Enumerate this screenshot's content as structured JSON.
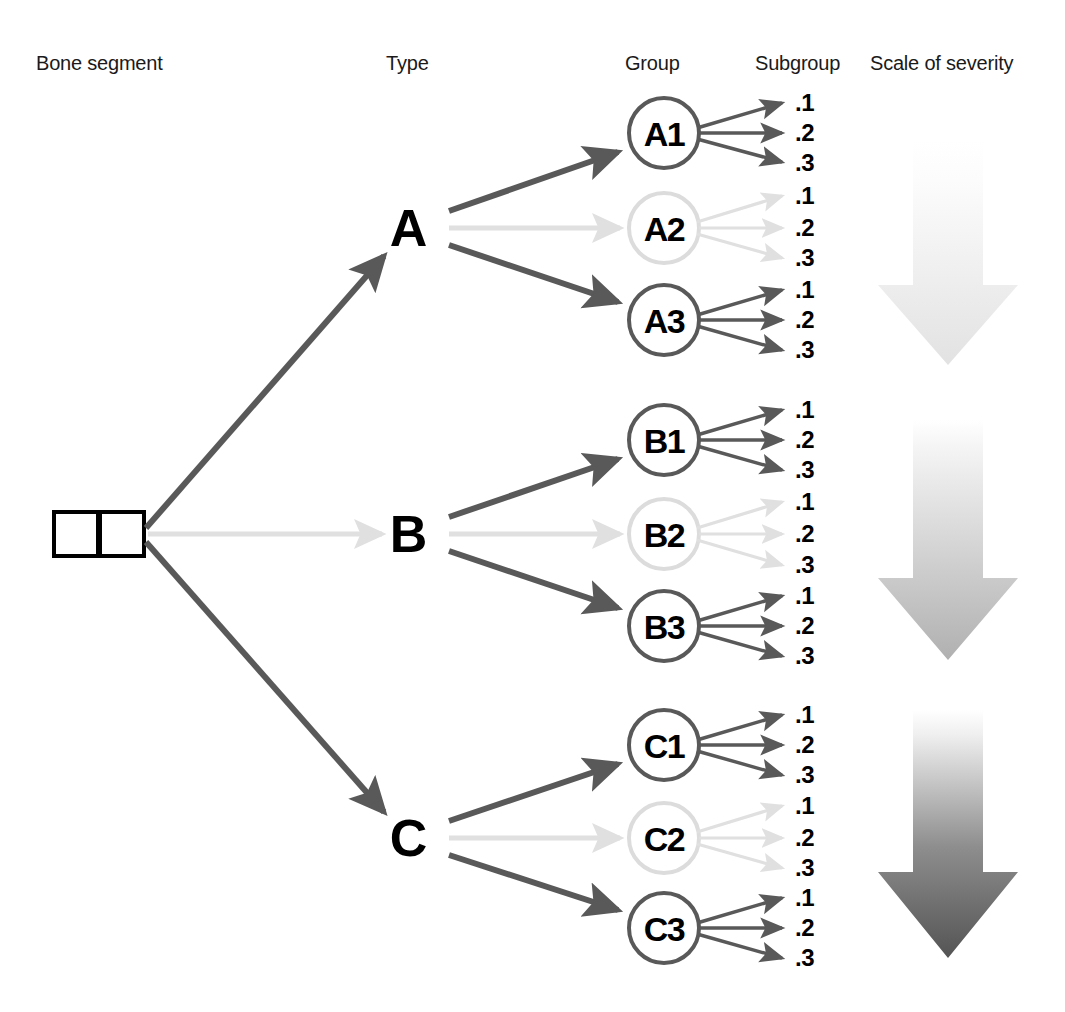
{
  "headers": [
    {
      "label": "Bone segment",
      "x": 36,
      "y": 52
    },
    {
      "label": "Type",
      "x": 386,
      "y": 52
    },
    {
      "label": "Group",
      "x": 625,
      "y": 52
    },
    {
      "label": "Subgroup",
      "x": 755,
      "y": 52
    },
    {
      "label": "Scale of severity",
      "x": 870,
      "y": 52
    }
  ],
  "bone_segment": {
    "name": "bone-segment-squares",
    "squares": [
      {
        "x": 54,
        "y": 512,
        "size": 44
      },
      {
        "x": 98,
        "y": 512,
        "size": 44
      }
    ],
    "border_color": "#000000"
  },
  "types": [
    {
      "id": "A",
      "label": "A",
      "x": 408,
      "y": 228
    },
    {
      "id": "B",
      "label": "B",
      "x": 408,
      "y": 534
    },
    {
      "id": "C",
      "label": "C",
      "x": 408,
      "y": 838
    }
  ],
  "groups": [
    {
      "id": "A1",
      "label": "A1",
      "cx": 664,
      "cy": 133,
      "r": 36,
      "tone": "dark"
    },
    {
      "id": "A2",
      "label": "A2",
      "cx": 664,
      "cy": 228,
      "r": 36,
      "tone": "light"
    },
    {
      "id": "A3",
      "label": "A3",
      "cx": 664,
      "cy": 320,
      "r": 36,
      "tone": "dark"
    },
    {
      "id": "B1",
      "label": "B1",
      "cx": 664,
      "cy": 440,
      "r": 36,
      "tone": "dark"
    },
    {
      "id": "B2",
      "label": "B2",
      "cx": 664,
      "cy": 534,
      "r": 36,
      "tone": "light"
    },
    {
      "id": "B3",
      "label": "B3",
      "cx": 664,
      "cy": 626,
      "r": 36,
      "tone": "dark"
    },
    {
      "id": "C1",
      "label": "C1",
      "cx": 664,
      "cy": 745,
      "r": 36,
      "tone": "dark"
    },
    {
      "id": "C2",
      "label": "C2",
      "cx": 664,
      "cy": 838,
      "r": 36,
      "tone": "light"
    },
    {
      "id": "C3",
      "label": "C3",
      "cx": 664,
      "cy": 928,
      "r": 36,
      "tone": "dark"
    }
  ],
  "subgroups": [
    {
      "group": "A1",
      "label": ".1",
      "x": 795,
      "y": 103,
      "tone": "dark"
    },
    {
      "group": "A1",
      "label": ".2",
      "x": 795,
      "y": 133,
      "tone": "dark"
    },
    {
      "group": "A1",
      "label": ".3",
      "x": 795,
      "y": 163,
      "tone": "dark"
    },
    {
      "group": "A2",
      "label": ".1",
      "x": 795,
      "y": 196,
      "tone": "light"
    },
    {
      "group": "A2",
      "label": ".2",
      "x": 795,
      "y": 228,
      "tone": "light"
    },
    {
      "group": "A2",
      "label": ".3",
      "x": 795,
      "y": 258,
      "tone": "light"
    },
    {
      "group": "A3",
      "label": ".1",
      "x": 795,
      "y": 290,
      "tone": "dark"
    },
    {
      "group": "A3",
      "label": ".2",
      "x": 795,
      "y": 320,
      "tone": "dark"
    },
    {
      "group": "A3",
      "label": ".3",
      "x": 795,
      "y": 350,
      "tone": "dark"
    },
    {
      "group": "B1",
      "label": ".1",
      "x": 795,
      "y": 410,
      "tone": "dark"
    },
    {
      "group": "B1",
      "label": ".2",
      "x": 795,
      "y": 440,
      "tone": "dark"
    },
    {
      "group": "B1",
      "label": ".3",
      "x": 795,
      "y": 470,
      "tone": "dark"
    },
    {
      "group": "B2",
      "label": ".1",
      "x": 795,
      "y": 502,
      "tone": "light"
    },
    {
      "group": "B2",
      "label": ".2",
      "x": 795,
      "y": 534,
      "tone": "light"
    },
    {
      "group": "B2",
      "label": ".3",
      "x": 795,
      "y": 565,
      "tone": "light"
    },
    {
      "group": "B3",
      "label": ".1",
      "x": 795,
      "y": 596,
      "tone": "dark"
    },
    {
      "group": "B3",
      "label": ".2",
      "x": 795,
      "y": 626,
      "tone": "dark"
    },
    {
      "group": "B3",
      "label": ".3",
      "x": 795,
      "y": 656,
      "tone": "dark"
    },
    {
      "group": "C1",
      "label": ".1",
      "x": 795,
      "y": 715,
      "tone": "dark"
    },
    {
      "group": "C1",
      "label": ".2",
      "x": 795,
      "y": 745,
      "tone": "dark"
    },
    {
      "group": "C1",
      "label": ".3",
      "x": 795,
      "y": 775,
      "tone": "dark"
    },
    {
      "group": "C2",
      "label": ".1",
      "x": 795,
      "y": 806,
      "tone": "light"
    },
    {
      "group": "C2",
      "label": ".2",
      "x": 795,
      "y": 838,
      "tone": "light"
    },
    {
      "group": "C2",
      "label": ".3",
      "x": 795,
      "y": 868,
      "tone": "light"
    },
    {
      "group": "C3",
      "label": ".1",
      "x": 795,
      "y": 898,
      "tone": "dark"
    },
    {
      "group": "C3",
      "label": ".2",
      "x": 795,
      "y": 928,
      "tone": "dark"
    },
    {
      "group": "C3",
      "label": ".3",
      "x": 795,
      "y": 958,
      "tone": "dark"
    }
  ],
  "trunk_arrows": [
    {
      "from": "bone-segment",
      "to": "A",
      "tone": "dark",
      "x1": 146,
      "y1": 530,
      "x2": 385,
      "y2": 258
    },
    {
      "from": "bone-segment",
      "to": "B",
      "tone": "light",
      "x1": 146,
      "y1": 534,
      "x2": 383,
      "y2": 534
    },
    {
      "from": "bone-segment",
      "to": "C",
      "tone": "dark",
      "x1": 146,
      "y1": 540,
      "x2": 385,
      "y2": 812
    }
  ],
  "type_to_group_arrows": [
    {
      "from": "A",
      "to": "A1",
      "tone": "dark"
    },
    {
      "from": "A",
      "to": "A2",
      "tone": "light"
    },
    {
      "from": "A",
      "to": "A3",
      "tone": "dark"
    },
    {
      "from": "B",
      "to": "B1",
      "tone": "dark"
    },
    {
      "from": "B",
      "to": "B2",
      "tone": "light"
    },
    {
      "from": "B",
      "to": "B3",
      "tone": "dark"
    },
    {
      "from": "C",
      "to": "C1",
      "tone": "dark"
    },
    {
      "from": "C",
      "to": "C2",
      "tone": "light"
    },
    {
      "from": "C",
      "to": "C3",
      "tone": "dark"
    }
  ],
  "severity_arrows": [
    {
      "name": "severity-arrow-a",
      "x": 878,
      "y": 140,
      "width": 140,
      "height": 225,
      "shaft_width": 70,
      "top_color": "#fdfdfd",
      "bottom_color": "#e3e3e3"
    },
    {
      "name": "severity-arrow-b",
      "x": 878,
      "y": 420,
      "width": 140,
      "height": 240,
      "shaft_width": 70,
      "top_color": "#fbfbfb",
      "bottom_color": "#b4b4b4"
    },
    {
      "name": "severity-arrow-c",
      "x": 878,
      "y": 710,
      "width": 140,
      "height": 248,
      "shaft_width": 70,
      "top_color": "#fafafa",
      "bottom_color": "#595959"
    }
  ],
  "colors": {
    "dark_stroke": "#595959",
    "light_stroke": "#e0e0e0",
    "circle_dark": "#595959",
    "circle_light": "#dcdcdc",
    "text": "#000000",
    "header_text": "#1a1a1a",
    "background": "#ffffff"
  },
  "diagram": {
    "type": "hierarchical-classification-tree",
    "levels": [
      "Bone segment",
      "Type",
      "Group",
      "Subgroup",
      "Scale of severity"
    ]
  }
}
